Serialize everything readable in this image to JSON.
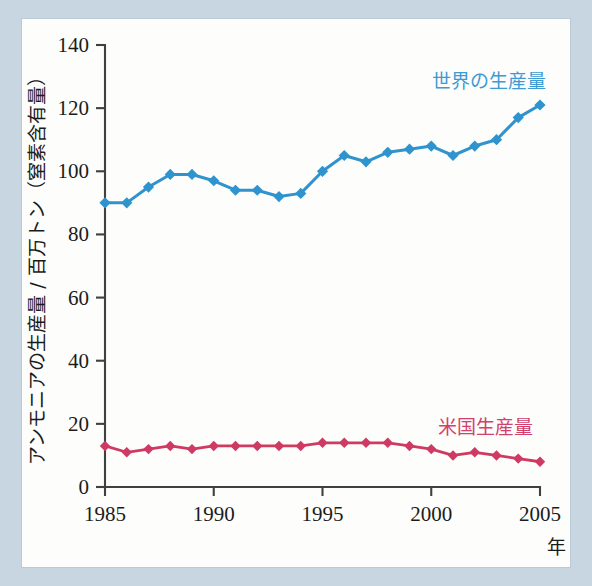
{
  "figure": {
    "background_color": "#c7d6e1",
    "plate_color": "#fdfdfc"
  },
  "chart_data": {
    "type": "line",
    "title": "",
    "xlabel": "年",
    "ylabel": "アンモニアの生産量 / 百万トン（窒素含有量）",
    "x": [
      1985,
      1986,
      1987,
      1988,
      1989,
      1990,
      1991,
      1992,
      1993,
      1994,
      1995,
      1996,
      1997,
      1998,
      1999,
      2000,
      2001,
      2002,
      2003,
      2004,
      2005
    ],
    "xlim": [
      1985,
      2005
    ],
    "ylim": [
      0,
      140
    ],
    "xticks": [
      1985,
      1990,
      1995,
      2000,
      2005
    ],
    "xtick_labels": [
      "1985",
      "1990",
      "1995",
      "2000",
      "2005"
    ],
    "yticks": [
      0,
      20,
      40,
      60,
      80,
      100,
      120,
      140
    ],
    "ytick_labels": [
      "0",
      "20",
      "40",
      "60",
      "80",
      "100",
      "120",
      "140"
    ],
    "grid": false,
    "legend_position": "inline-annotation",
    "series": [
      {
        "name": "世界の生産量",
        "color": "#2f93cd",
        "marker": "diamond",
        "label_x": 1999.0,
        "label_y": 128,
        "values": [
          90,
          90,
          95,
          99,
          99,
          97,
          94,
          94,
          92,
          93,
          100,
          105,
          103,
          106,
          107,
          108,
          105,
          108,
          110,
          117,
          121
        ]
      },
      {
        "name": "米国生産量",
        "color": "#cf3a63",
        "marker": "diamond",
        "label_x": 1999.3,
        "label_y": 21,
        "values": [
          13,
          11,
          12,
          13,
          12,
          13,
          13,
          13,
          13,
          13,
          14,
          14,
          14,
          14,
          13,
          12,
          10,
          11,
          10,
          9,
          8
        ]
      }
    ]
  },
  "axis": {
    "y_axis_title": "アンモニアの生産量 / 百万トン（窒素含有量）",
    "x_axis_title": "年"
  }
}
